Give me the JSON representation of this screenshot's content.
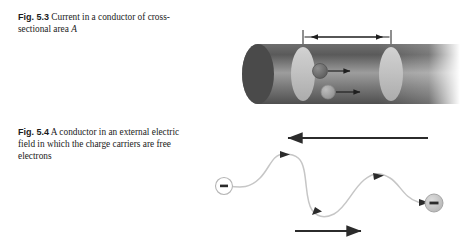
{
  "figure_53": {
    "caption_number": "Fig. 5.3",
    "caption_text": "Current in a conductor of cross-sectional area ",
    "caption_italic_tail": "A",
    "equation": {
      "delta_x": "Δx",
      "equals": "=",
      "v": "v",
      "v_subscript": "d",
      "delta_t": "Δt"
    },
    "labels": {
      "charge": "q",
      "velocity": "v",
      "velocity_subscript": "d",
      "area": "A"
    },
    "colors": {
      "cylinder_dark": "#595959",
      "cylinder_mid": "#8c8c8c",
      "cylinder_light": "#d8d8d8",
      "disk_face": "#c9c9c9",
      "charge_dark": "#6b6b6b",
      "charge_light": "#a8a8a8",
      "rule_line": "#222222"
    }
  },
  "figure_54": {
    "caption_number": "Fig. 5.4",
    "caption_text": "A conductor in an external electric field in which the charge carriers are free electrons",
    "labels": {
      "field": "E",
      "drift_velocity": "v",
      "drift_subscript": "d",
      "electron_sign": "−"
    },
    "colors": {
      "arrow": "#2b2b2b",
      "path": "#bdbdbd",
      "electron_fill": "#c4c4c4",
      "electron_stroke": "#9a9a9a"
    }
  }
}
